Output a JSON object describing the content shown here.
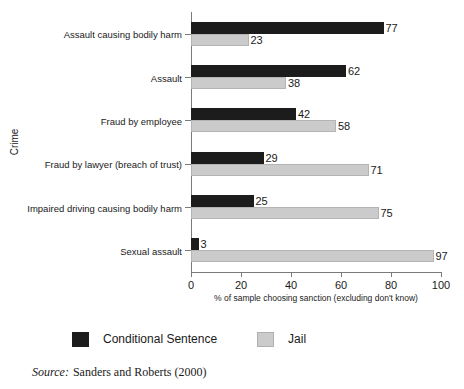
{
  "chart_data": {
    "type": "bar",
    "orientation": "horizontal",
    "grouped": true,
    "title": "",
    "xlabel": "% of sample choosing sanction (excluding don't know)",
    "ylabel": "Crime",
    "xlim": [
      0,
      100
    ],
    "xticks": [
      0,
      20,
      40,
      60,
      80,
      100
    ],
    "grid": false,
    "legend_position": "bottom-left",
    "categories": [
      "Assault causing bodily harm",
      "Assault",
      "Fraud by employee",
      "Fraud by lawyer (breach of trust)",
      "Impaired driving causing bodily harm",
      "Sexual assault"
    ],
    "series": [
      {
        "name": "Conditional Sentence",
        "color": "#1c1c1c",
        "values": [
          77,
          62,
          42,
          29,
          25,
          3
        ]
      },
      {
        "name": "Jail",
        "color": "#cbcbcb",
        "values": [
          23,
          38,
          58,
          71,
          75,
          97
        ]
      }
    ]
  },
  "source": {
    "label": "Source:",
    "text": "Sanders and Roberts (2000)"
  }
}
